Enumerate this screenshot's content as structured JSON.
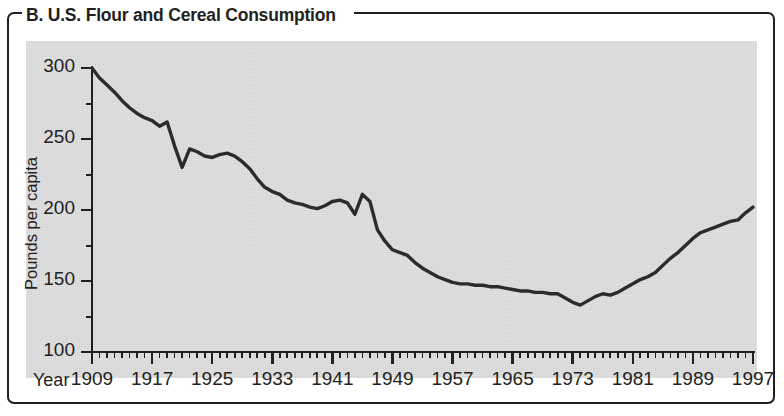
{
  "figure": {
    "panel_label": "B.",
    "title": "B. U.S. Flour and Cereal Consumption",
    "background_color": "#ffffff",
    "panel_color": "#d4d4d4",
    "line_color": "#2b2b2b",
    "frame_color": "#231f20"
  },
  "chart_data": {
    "type": "line",
    "title": "B. U.S. Flour and Cereal Consumption",
    "xlabel": "Year",
    "ylabel": "Pounds per capita",
    "xlim": [
      1909,
      1997
    ],
    "ylim": [
      100,
      300
    ],
    "xticks": [
      1909,
      1917,
      1925,
      1933,
      1941,
      1949,
      1957,
      1965,
      1973,
      1981,
      1989,
      1997
    ],
    "xtick_labels": [
      "1909",
      "1917",
      "1925",
      "1933",
      "1941",
      "1949",
      "1957",
      "1965",
      "1973",
      "1981",
      "1989",
      "1997"
    ],
    "yticks": [
      100,
      150,
      200,
      250,
      300
    ],
    "ytick_labels": [
      "100",
      "150",
      "200",
      "250",
      "300"
    ],
    "minor_xtick_interval": 1,
    "minor_ytick_interval": 25,
    "grid": false,
    "legend": false,
    "series": [
      {
        "name": "U.S. flour and cereal consumption",
        "units": "pounds per capita",
        "x": [
          1909,
          1910,
          1911,
          1912,
          1913,
          1914,
          1915,
          1916,
          1917,
          1918,
          1919,
          1920,
          1921,
          1922,
          1923,
          1924,
          1925,
          1926,
          1927,
          1928,
          1929,
          1930,
          1931,
          1932,
          1933,
          1934,
          1935,
          1936,
          1937,
          1938,
          1939,
          1940,
          1941,
          1942,
          1943,
          1944,
          1945,
          1946,
          1947,
          1948,
          1949,
          1950,
          1951,
          1952,
          1953,
          1954,
          1955,
          1956,
          1957,
          1958,
          1959,
          1960,
          1961,
          1962,
          1963,
          1964,
          1965,
          1966,
          1967,
          1968,
          1969,
          1970,
          1971,
          1972,
          1973,
          1974,
          1975,
          1976,
          1977,
          1978,
          1979,
          1980,
          1981,
          1982,
          1983,
          1984,
          1985,
          1986,
          1987,
          1988,
          1989,
          1990,
          1991,
          1992,
          1993,
          1994,
          1995,
          1996,
          1997
        ],
        "y": [
          300,
          293,
          288,
          283,
          277,
          272,
          268,
          265,
          263,
          259,
          262,
          245,
          230,
          243,
          241,
          238,
          237,
          239,
          240,
          238,
          234,
          229,
          222,
          216,
          213,
          211,
          207,
          205,
          204,
          202,
          201,
          203,
          206,
          207,
          205,
          197,
          211,
          206,
          186,
          178,
          172,
          170,
          168,
          163,
          159,
          156,
          153,
          151,
          149,
          148,
          148,
          147,
          147,
          146,
          146,
          145,
          144,
          143,
          143,
          142,
          142,
          141,
          141,
          138,
          135,
          133,
          136,
          139,
          141,
          140,
          142,
          145,
          148,
          151,
          153,
          156,
          161,
          166,
          170,
          175,
          180,
          184,
          186,
          188,
          190,
          192,
          193,
          198,
          202
        ]
      }
    ],
    "annotations": []
  },
  "axes": {
    "y_axis_title": "Pounds per capita",
    "x_axis_word": "Year"
  }
}
